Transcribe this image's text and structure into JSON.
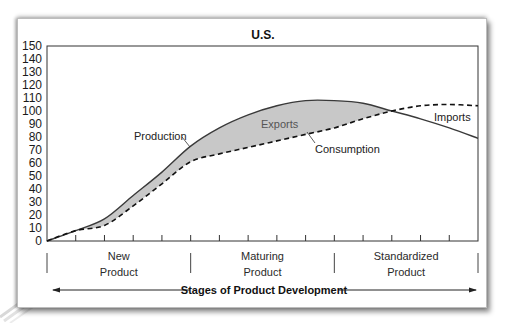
{
  "chart_data": {
    "type": "line",
    "title": "U.S.",
    "xlabel": "Stages of Product Development",
    "ylabel": "",
    "ylim": [
      0,
      150
    ],
    "yticks": [
      0,
      10,
      20,
      30,
      40,
      50,
      60,
      70,
      80,
      90,
      100,
      110,
      120,
      130,
      140,
      150
    ],
    "grid": false,
    "legend": "inline annotations",
    "x": [
      0,
      1,
      2,
      3,
      4,
      5,
      6,
      7,
      8,
      9,
      10,
      11,
      12,
      13,
      14,
      15
    ],
    "stages": [
      {
        "line1": "New",
        "line2": "Product"
      },
      {
        "line1": "Maturing",
        "line2": "Product"
      },
      {
        "line1": "Standardized",
        "line2": "Product"
      }
    ],
    "series": [
      {
        "name": "Production",
        "style": "solid",
        "values": [
          0,
          8,
          17,
          35,
          53,
          73,
          87,
          97,
          104,
          108,
          108,
          106,
          100,
          94,
          87,
          79
        ]
      },
      {
        "name": "Consumption",
        "style": "dashed",
        "values": [
          0,
          8,
          12,
          27,
          44,
          61,
          67,
          72,
          77,
          82,
          87,
          94,
          100,
          104,
          105,
          104
        ]
      }
    ],
    "annotations": [
      {
        "text": "Production",
        "target": "Production"
      },
      {
        "text": "Exports",
        "region": "Production above Consumption (shaded)"
      },
      {
        "text": "Consumption",
        "target": "Consumption"
      },
      {
        "text": "Imports",
        "region": "Consumption above Production"
      }
    ],
    "colors": {
      "fill": "#c8c8c8",
      "line": "#3a3a3a",
      "axis": "#333333"
    }
  }
}
